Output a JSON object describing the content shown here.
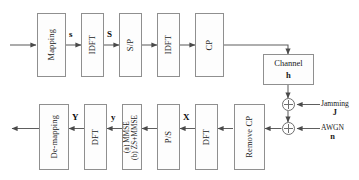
{
  "diagram": {
    "colors": {
      "background": "#ffffff",
      "block_border": "#8f8f8f",
      "block_fill": "#fdfdfd",
      "wire": "#5e5e5e",
      "text": "#1a1a1a"
    },
    "transmitter_chain": [
      {
        "id": "mapping",
        "label": "Mapping"
      },
      {
        "id": "idft1",
        "label": "IDFT"
      },
      {
        "id": "sp",
        "label": "S/P"
      },
      {
        "id": "idft2",
        "label": "IDFT"
      },
      {
        "id": "cp",
        "label": "CP"
      }
    ],
    "channel": {
      "id": "channel",
      "label": "Channel",
      "gain_symbol": "h"
    },
    "noise_sources": [
      {
        "id": "jamming",
        "label": "Jamming",
        "symbol": "J",
        "operator": "plus-circle"
      },
      {
        "id": "awgn",
        "label": "AWGN",
        "symbol": "n",
        "operator": "plus-circle"
      }
    ],
    "receiver_chain": [
      {
        "id": "remove-cp",
        "label": "Remove CP"
      },
      {
        "id": "dft1",
        "label": "DFT"
      },
      {
        "id": "ps",
        "label": "P/S"
      },
      {
        "id": "equalizer",
        "label_line1": "(a) MMSE",
        "label_line2": "(b) ZS+MMSE"
      },
      {
        "id": "dft2",
        "label": "DFT"
      },
      {
        "id": "de-mapping",
        "label": "De-mapping"
      }
    ],
    "signal_labels": [
      {
        "id": "s-lower-tx",
        "text": "s"
      },
      {
        "id": "s-upper-tx",
        "text": "S"
      },
      {
        "id": "x-upper-rx",
        "text": "X"
      },
      {
        "id": "y-lower-rx",
        "text": "y"
      },
      {
        "id": "y-upper-rx",
        "text": "Y"
      }
    ]
  }
}
